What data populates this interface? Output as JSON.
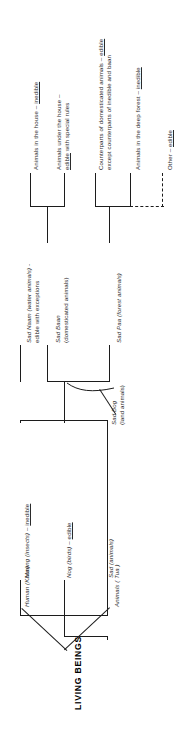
{
  "diagram": {
    "title": "LIVING BEINGS",
    "type": "taxonomy-tree",
    "orientation": "rotated-90-ccw",
    "root": {
      "id": "living-beings",
      "label": "LIVING BEINGS"
    },
    "level1": [
      {
        "id": "human",
        "label": "Human (Khon)"
      },
      {
        "id": "animals",
        "label": "Animals ( Tua )"
      }
    ],
    "level2": [
      {
        "id": "maeng",
        "label": "Maeng (insects) – inedible",
        "term": "Maeng (insects) – ",
        "verdict": "inedible"
      },
      {
        "id": "nog",
        "label": "Nog (birds) – edible",
        "term": "Nog (birds) – ",
        "verdict": "edible"
      },
      {
        "id": "sad",
        "label": "Sad (animals)",
        "term": "Sad (animals)",
        "verdict": ""
      }
    ],
    "level3": [
      {
        "id": "sad-bog",
        "line1": "Sad Bog",
        "line2": "(land animals)"
      },
      {
        "id": "sad-naam",
        "line1": "Sad Naam (water animals) -",
        "line2": "edible with exceptions"
      }
    ],
    "level4": [
      {
        "id": "sad-baan",
        "line1": "Sad Baan",
        "line2": "(domesticated animals)"
      },
      {
        "id": "sad-paa",
        "line1": "Sad Paa (forest animals)",
        "line2": ""
      }
    ],
    "leaves": [
      {
        "id": "animals-in-house",
        "parent": "sad-baan",
        "line1_pre": "Animals in the house –  ",
        "line1_verdict": "inedible",
        "line2": ""
      },
      {
        "id": "animals-under-house",
        "parent": "sad-baan",
        "line1_pre": "Animals under the house –",
        "line1_verdict": "",
        "line2_verdict": "edible",
        "line2_post": " with special rules"
      },
      {
        "id": "counterparts-domesticated",
        "parent": "sad-paa",
        "line1_pre": "Counterparts of domesticated animals –  ",
        "line1_verdict": "edible",
        "line2": "except counterparts of inedible and baan"
      },
      {
        "id": "animals-deep-forest",
        "parent": "sad-paa",
        "line1_pre": "Animals in the deep forest –  ",
        "line1_verdict": "inedible",
        "line2": ""
      },
      {
        "id": "other",
        "parent": "sad-paa",
        "line1_pre": "Other –  ",
        "line1_verdict": "edible",
        "line2": "",
        "connector": "dashed"
      }
    ],
    "colors": {
      "stroke": "#1c1c1c",
      "text": "#2b2b2b",
      "background": "#ffffff"
    }
  }
}
